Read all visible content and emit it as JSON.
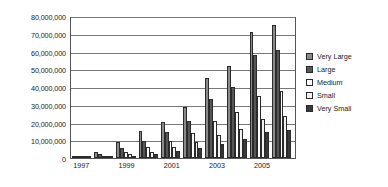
{
  "chart_data": {
    "type": "bar",
    "title": "",
    "xlabel": "",
    "ylabel": "",
    "ylim": [
      0,
      80000000
    ],
    "grid": true,
    "legend_position": "right",
    "categories": [
      "1997",
      "1998",
      "1999",
      "2000",
      "2001",
      "2002",
      "2003",
      "2004",
      "2005",
      "2006"
    ],
    "tick_labels_x": [
      "1997",
      "1999",
      "2001",
      "2003",
      "2005"
    ],
    "tick_labels_y": [
      "0",
      "10,000,000",
      "20,000,000",
      "30,000,000",
      "40,000,000",
      "50,000,000",
      "60,000,000",
      "70,000,000",
      "80,000,000"
    ],
    "ytick_values": [
      0,
      10000000,
      20000000,
      30000000,
      40000000,
      50000000,
      60000000,
      70000000,
      80000000
    ],
    "series": [
      {
        "name": "Very Large",
        "color": "#8a8a8a",
        "values": [
          1200000,
          3500000,
          9000000,
          15000000,
          20500000,
          29000000,
          45000000,
          52000000,
          71000000,
          75000000
        ]
      },
      {
        "name": "Large",
        "color": "#565656",
        "values": [
          900000,
          2300000,
          5500000,
          9500000,
          14500000,
          21000000,
          33000000,
          40000000,
          58000000,
          61000000
        ]
      },
      {
        "name": "Medium",
        "color": "#ffffff",
        "values": [
          600000,
          1400000,
          3300000,
          6000000,
          9500000,
          14000000,
          21000000,
          26000000,
          35000000,
          38000000
        ]
      },
      {
        "name": "Small",
        "color": "#f2f2f2",
        "values": [
          400000,
          900000,
          2000000,
          3600000,
          6000000,
          9000000,
          13000000,
          16500000,
          22000000,
          23500000
        ]
      },
      {
        "name": "Very Small",
        "color": "#3a3a3a",
        "values": [
          250000,
          600000,
          1300000,
          2300000,
          3800000,
          5500000,
          8000000,
          10500000,
          14500000,
          16000000
        ]
      }
    ]
  },
  "legend": {
    "items": [
      {
        "label": "Very Large"
      },
      {
        "label": "Large"
      },
      {
        "label": "Medium"
      },
      {
        "label": "Small"
      },
      {
        "label": "Very Small"
      }
    ]
  }
}
